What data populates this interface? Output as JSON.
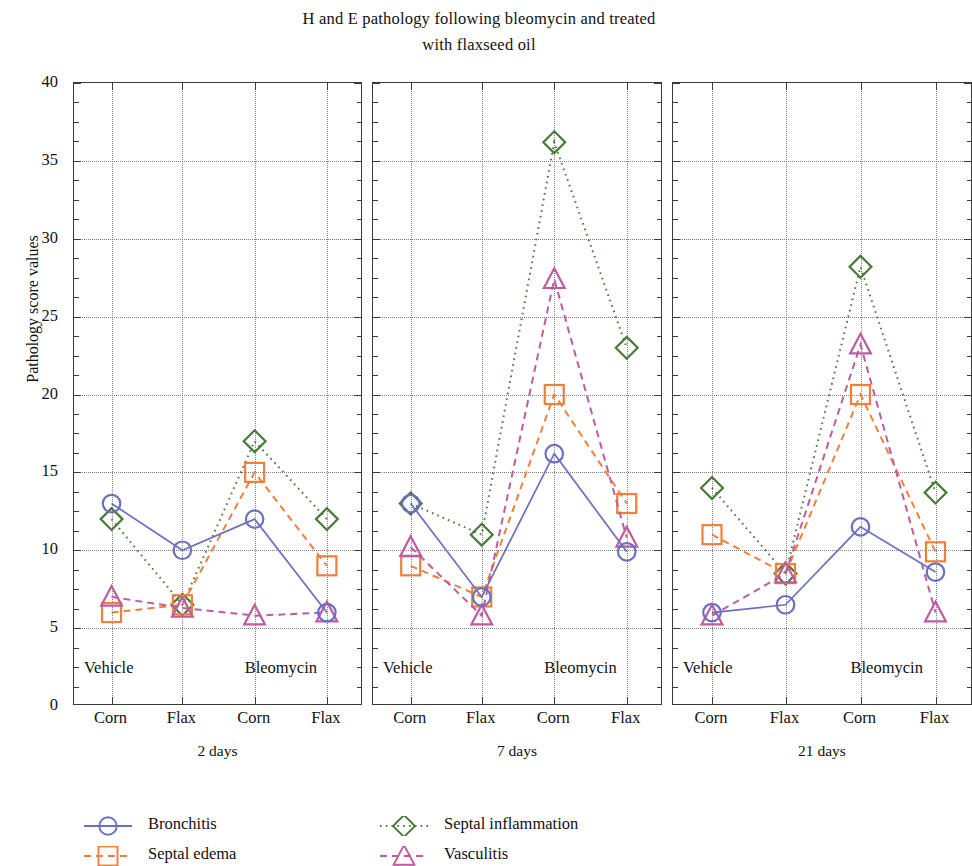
{
  "chart_data": {
    "type": "line",
    "title": "H and E pathology following bleomycin and treated with flaxseed oil",
    "title_line1": "H and E pathology following bleomycin and treated",
    "title_line2": "with flaxseed oil",
    "xlabel": "",
    "ylabel": "Pathology score values",
    "ylim": [
      0,
      40
    ],
    "ytick_step": 5,
    "yticks": [
      0,
      5,
      10,
      15,
      20,
      25,
      30,
      35,
      40
    ],
    "grid": true,
    "legend_position": "bottom",
    "categories": [
      "Corn",
      "Flax",
      "Corn",
      "Flax"
    ],
    "group_labels": [
      "Vehicle",
      "Bleomycin"
    ],
    "panels": [
      {
        "name": "2 days",
        "series": [
          {
            "name": "Bronchitis",
            "values": [
              13,
              10,
              12,
              6
            ]
          },
          {
            "name": "Septal edema",
            "values": [
              6,
              6.5,
              15,
              9
            ]
          },
          {
            "name": "Septal inflammation",
            "values": [
              12,
              6.5,
              17,
              12
            ]
          },
          {
            "name": "Vasculitis",
            "values": [
              7,
              6.3,
              5.8,
              6
            ]
          }
        ]
      },
      {
        "name": "7 days",
        "series": [
          {
            "name": "Bronchitis",
            "values": [
              13,
              7,
              16.2,
              9.9
            ]
          },
          {
            "name": "Septal edema",
            "values": [
              9,
              7,
              20,
              13
            ]
          },
          {
            "name": "Septal inflammation",
            "values": [
              13,
              11,
              36.2,
              23
            ]
          },
          {
            "name": "Vasculitis",
            "values": [
              10.2,
              5.8,
              27.4,
              10.8
            ]
          }
        ]
      },
      {
        "name": "21 days",
        "series": [
          {
            "name": "Bronchitis",
            "values": [
              6,
              6.5,
              11.5,
              8.6
            ]
          },
          {
            "name": "Septal edema",
            "values": [
              11,
              8.5,
              20,
              9.9
            ]
          },
          {
            "name": "Septal inflammation",
            "values": [
              14,
              8.5,
              28.2,
              13.7
            ]
          },
          {
            "name": "Vasculitis",
            "values": [
              5.8,
              8.5,
              23.2,
              6
            ]
          }
        ]
      }
    ],
    "legend": [
      {
        "name": "Bronchitis",
        "color": "#6b6fc0",
        "marker": "circle",
        "dash": "solid"
      },
      {
        "name": "Septal edema",
        "color": "#f07f3c",
        "marker": "square",
        "dash": "dashed"
      },
      {
        "name": "Septal inflammation",
        "color": "#4a7a3a",
        "marker": "diamond",
        "dash": "dotted"
      },
      {
        "name": "Vasculitis",
        "color": "#bf5ba0",
        "marker": "triangle",
        "dash": "dashed"
      }
    ]
  }
}
